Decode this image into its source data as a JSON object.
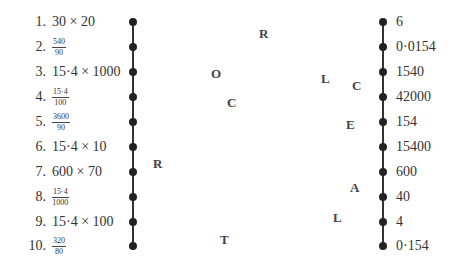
{
  "questions": [
    {
      "num": "1.",
      "type": "expr",
      "text": "30 × 20"
    },
    {
      "num": "2.",
      "type": "frac",
      "numerator": "540",
      "denominator": "90"
    },
    {
      "num": "3.",
      "type": "expr",
      "text": "15·4 × 1000"
    },
    {
      "num": "4.",
      "type": "frac",
      "numerator": "15·4",
      "denominator": "100"
    },
    {
      "num": "5.",
      "type": "frac",
      "numerator": "3600",
      "denominator": "90"
    },
    {
      "num": "6.",
      "type": "expr",
      "text": "15·4 × 10"
    },
    {
      "num": "7.",
      "type": "expr",
      "text": "600 × 70"
    },
    {
      "num": "8.",
      "type": "frac",
      "numerator": "15·4",
      "denominator": "1000"
    },
    {
      "num": "9.",
      "type": "expr",
      "text": "15·4 × 100"
    },
    {
      "num": "10.",
      "type": "frac",
      "numerator": "320",
      "denominator": "80"
    }
  ],
  "answers": [
    "6",
    "0·0154",
    "1540",
    "42000",
    "154",
    "15400",
    "600",
    "40",
    "4",
    "0·154"
  ],
  "letters": [
    {
      "char": "R",
      "x": 259,
      "y": 27
    },
    {
      "char": "O",
      "x": 211,
      "y": 67
    },
    {
      "char": "C",
      "x": 227,
      "y": 96
    },
    {
      "char": "L",
      "x": 321,
      "y": 72
    },
    {
      "char": "C",
      "x": 352,
      "y": 79
    },
    {
      "char": "E",
      "x": 346,
      "y": 118
    },
    {
      "char": "R",
      "x": 153,
      "y": 157
    },
    {
      "char": "A",
      "x": 350,
      "y": 181
    },
    {
      "char": "L",
      "x": 333,
      "y": 211
    },
    {
      "char": "T",
      "x": 220,
      "y": 233
    }
  ]
}
